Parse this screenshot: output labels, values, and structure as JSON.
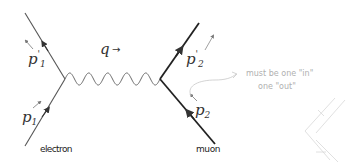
{
  "diagram": {
    "labels": {
      "p1_prime": "p",
      "p1_prime_sup": "'",
      "p1_prime_sub": "1",
      "p1": "p",
      "p1_sub": "1",
      "p2_prime": "p",
      "p2_prime_sup": "'",
      "p2_prime_sub": "2",
      "p2": "p",
      "p2_sub": "2",
      "q": "q",
      "q_arrow": "→",
      "electron": "electron",
      "muon": "muon"
    },
    "annotation": {
      "line1": "must be one \"in\"",
      "line2": "one \"out\""
    },
    "colors": {
      "electron_line": "#555555",
      "muon_line": "#222222",
      "photon_line": "#666666",
      "annotation": "#b8b8b8"
    }
  }
}
